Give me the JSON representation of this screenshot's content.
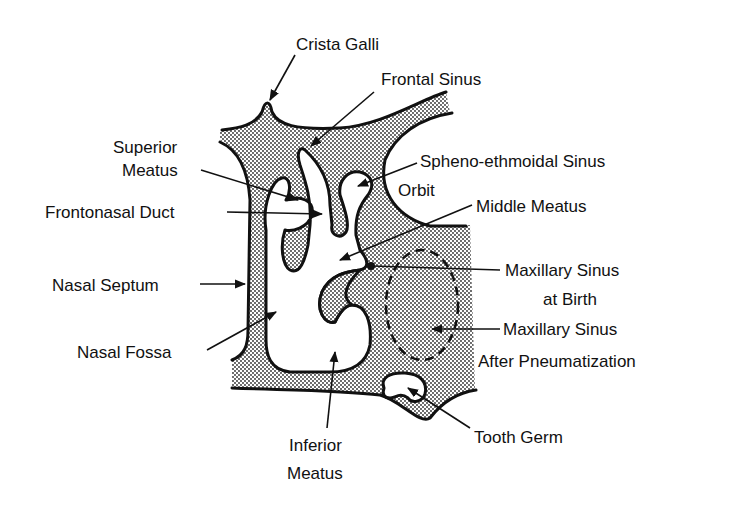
{
  "diagram": {
    "type": "anatomical-cross-section",
    "colors": {
      "outline": "#111111",
      "bone_stipple": "#2a2a2a",
      "background": "#ffffff"
    },
    "labels": {
      "crista_galli": "Crista Galli",
      "frontal_sinus": "Frontal Sinus",
      "superior_meatus_1": "Superior",
      "superior_meatus_2": "Meatus",
      "spheno_ethmoidal_sinus": "Spheno-ethmoidal Sinus",
      "orbit": "Orbit",
      "frontonasal_duct": "Frontonasal Duct",
      "middle_meatus": "Middle Meatus",
      "nasal_septum": "Nasal Septum",
      "maxillary_birth_1": "Maxillary Sinus",
      "maxillary_birth_2": "at Birth",
      "maxillary_after_1": "Maxillary Sinus",
      "maxillary_after_2": "After Pneumatization",
      "nasal_fossa": "Nasal Fossa",
      "tooth_germ": "Tooth Germ",
      "inferior_meatus_1": "Inferior",
      "inferior_meatus_2": "Meatus"
    }
  }
}
